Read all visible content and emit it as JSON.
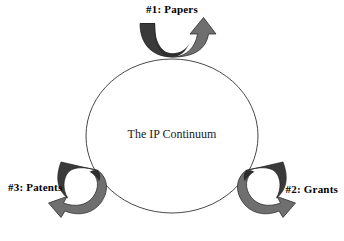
{
  "diagram": {
    "title": "The IP Continuum",
    "type": "cycle-diagram",
    "center_label": "The IP Continuum",
    "background_color": "#ffffff",
    "circle": {
      "name": "continuum-circle",
      "stroke_color": "#222222",
      "fill": "none",
      "center_x": 172,
      "center_y": 136,
      "radius_x": 86,
      "radius_y": 77
    },
    "arrow_colors": {
      "dark": "#3c3c3c",
      "light": "#757575",
      "outline": "#1c1c1c"
    },
    "steps": [
      {
        "id": "papers",
        "label": "#1: Papers",
        "number": "#1",
        "name": "Papers",
        "position": "top",
        "arrow_name": "papers-arrow",
        "arrow_direction": "up-right"
      },
      {
        "id": "grants",
        "label": "#2: Grants",
        "number": "#2",
        "name": "Grants",
        "position": "bottom-right",
        "arrow_name": "grants-arrow",
        "arrow_direction": "down-right"
      },
      {
        "id": "patents",
        "label": "#3: Patents",
        "number": "#3",
        "name": "Patents",
        "position": "bottom-left",
        "arrow_name": "patents-arrow",
        "arrow_direction": "down-left"
      }
    ]
  }
}
